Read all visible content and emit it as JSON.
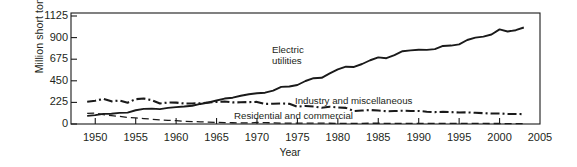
{
  "chart_data": {
    "type": "line",
    "title": "",
    "subtitle": "",
    "xlabel": "Year",
    "ylabel": "Million short tons",
    "xlim": [
      1947,
      2005
    ],
    "ylim": [
      0,
      1200
    ],
    "xticks": [
      1950,
      1955,
      1960,
      1965,
      1970,
      1975,
      1980,
      1985,
      1990,
      1995,
      2000,
      2005
    ],
    "yticks": [
      0,
      225,
      450,
      675,
      900,
      1125
    ],
    "grid": false,
    "legend_position": "inline-annotations",
    "annotations": [
      {
        "text": "Electric utilities",
        "x": 1974,
        "y": 700
      },
      {
        "text": "Industry and miscellaneous",
        "x": 1983,
        "y": 280
      },
      {
        "text": "Residential and commercial",
        "x": 1980,
        "y": 120
      }
    ],
    "series": [
      {
        "name": "Electric utilities",
        "style": "solid",
        "x": [
          1949,
          1950,
          1951,
          1952,
          1953,
          1954,
          1955,
          1956,
          1957,
          1958,
          1959,
          1960,
          1961,
          1962,
          1963,
          1964,
          1965,
          1966,
          1967,
          1968,
          1969,
          1970,
          1971,
          1972,
          1973,
          1974,
          1975,
          1976,
          1977,
          1978,
          1979,
          1980,
          1981,
          1982,
          1983,
          1984,
          1985,
          1986,
          1987,
          1988,
          1989,
          1990,
          1991,
          1992,
          1993,
          1994,
          1995,
          1996,
          1997,
          1998,
          1999,
          2000,
          2001,
          2002,
          2003
        ],
        "values": [
          85,
          92,
          105,
          107,
          116,
          118,
          143,
          158,
          160,
          155,
          168,
          176,
          182,
          190,
          209,
          224,
          245,
          265,
          274,
          294,
          310,
          320,
          326,
          348,
          387,
          391,
          406,
          448,
          477,
          481,
          527,
          569,
          597,
          594,
          625,
          664,
          694,
          685,
          718,
          758,
          767,
          774,
          772,
          780,
          813,
          817,
          829,
          875,
          900,
          910,
          932,
          986,
          964,
          977,
          1005
        ]
      },
      {
        "name": "Industry and miscellaneous",
        "style": "dash-dot",
        "x": [
          1949,
          1950,
          1951,
          1952,
          1953,
          1954,
          1955,
          1956,
          1957,
          1958,
          1959,
          1960,
          1961,
          1962,
          1963,
          1964,
          1965,
          1966,
          1967,
          1968,
          1969,
          1970,
          1971,
          1972,
          1973,
          1974,
          1975,
          1976,
          1977,
          1978,
          1979,
          1980,
          1981,
          1982,
          1983,
          1984,
          1985,
          1986,
          1987,
          1988,
          1989,
          1990,
          1991,
          1992,
          1993,
          1994,
          1995,
          1996,
          1997,
          1998,
          1999,
          2000,
          2001,
          2002,
          2003
        ],
        "values": [
          232,
          242,
          262,
          236,
          245,
          222,
          259,
          265,
          248,
          214,
          224,
          223,
          214,
          214,
          216,
          224,
          230,
          235,
          225,
          226,
          228,
          230,
          209,
          211,
          214,
          210,
          180,
          188,
          183,
          169,
          180,
          172,
          168,
          135,
          140,
          146,
          140,
          133,
          135,
          138,
          136,
          136,
          128,
          124,
          126,
          124,
          120,
          121,
          117,
          113,
          109,
          110,
          105,
          104,
          103
        ]
      },
      {
        "name": "Residential and commercial",
        "style": "dashed",
        "x": [
          1949,
          1950,
          1951,
          1952,
          1953,
          1954,
          1955,
          1956,
          1957,
          1958,
          1959,
          1960,
          1961,
          1962,
          1963,
          1964,
          1965,
          1966,
          1967,
          1968,
          1969,
          1970,
          1971,
          1972,
          1973,
          1974,
          1975,
          1976,
          1977,
          1978,
          1979,
          1980,
          1981,
          1982,
          1983,
          1984,
          1985,
          1986,
          1987,
          1988,
          1989,
          1990,
          1991,
          1992,
          1993,
          1994,
          1995,
          1996,
          1997,
          1998,
          1999,
          2000,
          2001,
          2002,
          2003
        ],
        "values": [
          110,
          114,
          98,
          88,
          79,
          67,
          64,
          57,
          50,
          42,
          38,
          35,
          28,
          25,
          23,
          20,
          17,
          15,
          13,
          12,
          11,
          16,
          14,
          12,
          10,
          10,
          9,
          9,
          9,
          9,
          8,
          7,
          7,
          7,
          7,
          8,
          8,
          7,
          7,
          7,
          6,
          6,
          6,
          6,
          6,
          6,
          6,
          6,
          6,
          6,
          5,
          5,
          4,
          4,
          4
        ]
      }
    ]
  },
  "axes": {
    "ylabel": "Million short tons",
    "xlabel": "Year",
    "ytick_labels": [
      "0",
      "225",
      "450",
      "675",
      "900",
      "1125"
    ],
    "xtick_labels": [
      "1950",
      "1955",
      "1960",
      "1965",
      "1970",
      "1975",
      "1980",
      "1985",
      "1990",
      "1995",
      "2000",
      "2005"
    ]
  },
  "labels": {
    "electric_line1": "Electric",
    "electric_line2": "utilities",
    "industry": "Industry and miscellaneous",
    "residential": "Residential and commercial"
  },
  "colors": {
    "line": "#1a1a1a",
    "axis": "#1a1a1a",
    "text": "#231f20",
    "background": "#ffffff"
  }
}
